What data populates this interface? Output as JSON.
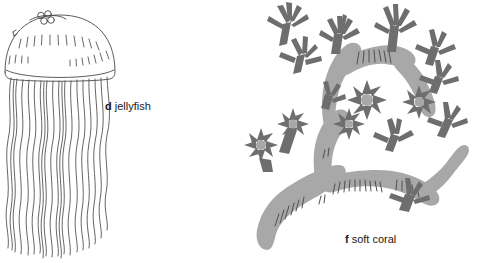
{
  "figure": {
    "width": 479,
    "height": 263,
    "background_color": "#ffffff",
    "style": "scientific line and tone illustration",
    "panels": [
      {
        "id": "jellyfish",
        "letter": "d",
        "name": "jellyfish",
        "render_style": "black line art, unfilled",
        "line_color": "#4a4a4a",
        "features": [
          "dome-shaped bell",
          "apex cluster of four small circles",
          "radial hatch marks on bell",
          "rim line at bell margin",
          "about twenty long wavy tentacles"
        ],
        "tentacle_count": 20
      },
      {
        "id": "soft-coral",
        "letter": "f",
        "name": "soft coral",
        "render_style": "gray filled silhouette with darker polyps",
        "branch_fill": "#a8a8a8",
        "polyp_fill": "#6e6e6e",
        "texture_line_color": "#4f4f4f",
        "features": [
          "thick trunk rising from lower left",
          "forked upper branches",
          "stalked polyps with radiating tentacles",
          "face-on star-shaped polyps",
          "hatch texture lines along branches"
        ]
      }
    ]
  },
  "labels": {
    "jellyfish": {
      "letter": "d",
      "text": "jellyfish"
    },
    "soft_coral": {
      "letter": "f",
      "text": "soft coral"
    }
  },
  "colors": {
    "background": "#ffffff",
    "ink": "#1a1a1a",
    "line_art": "#4a4a4a",
    "branch_gray": "#a8a8a8",
    "polyp_gray": "#6e6e6e"
  }
}
